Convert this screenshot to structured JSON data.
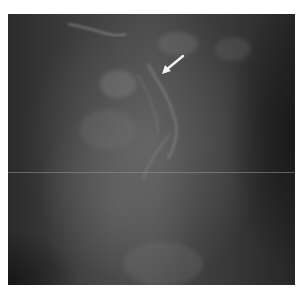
{
  "image": {
    "description": "Grayscale radiographic (mammogram-style) image with a white arrow pointing to a feature",
    "frame": {
      "x": 8,
      "y": 14,
      "width": 287,
      "height": 271
    },
    "colors": {
      "background": "#ffffff",
      "tissue_mid": "#4a4a4a",
      "tissue_dark": "#262626",
      "arrow": "#f2f2f2",
      "scanline": "#969696"
    },
    "arrow": {
      "direction": "down-left",
      "tail": {
        "x": 183,
        "y": 56
      },
      "tip": {
        "x": 162,
        "y": 74
      }
    },
    "scanline_y": 172
  }
}
